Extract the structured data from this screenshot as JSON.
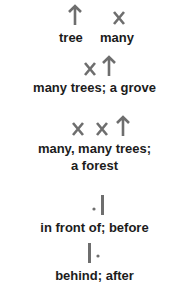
{
  "colors": {
    "glyph": "#6e6e6e",
    "text": "#1c1c1c",
    "background": "#ffffff"
  },
  "entries": [
    {
      "glyphs": [
        "tree-arrow",
        "many-x"
      ],
      "label_lines": [
        "tree  many"
      ]
    },
    {
      "glyphs": [
        "x",
        "arrow"
      ],
      "label_lines": [
        "many trees; a grove"
      ]
    },
    {
      "glyphs": [
        "x",
        "x",
        "arrow"
      ],
      "label_lines": [
        "many, many trees;",
        "a forest"
      ]
    },
    {
      "glyphs": [
        "dot",
        "bar"
      ],
      "label_lines": [
        "in front of; before"
      ]
    },
    {
      "glyphs": [
        "bar",
        "dot"
      ],
      "label_lines": [
        "behind; after"
      ]
    }
  ],
  "words": {
    "tree": "tree",
    "many": "many",
    "grove": "many trees; a grove",
    "forest_1": "many, many trees;",
    "forest_2": "a forest",
    "before": "in front of; before",
    "after": "behind; after"
  }
}
